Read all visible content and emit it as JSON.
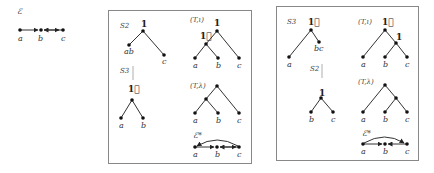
{
  "left_graph": {
    "title": "ℰ",
    "nodes": [
      "a",
      "b",
      "c"
    ]
  },
  "panels": [
    {
      "step_label": "S2",
      "step_tree": {
        "root": "1",
        "leaves": [
          "ab",
          "c"
        ]
      },
      "sub_step_label": "S3",
      "sub_tree": {
        "root": "1⃗",
        "leaves": [
          "a",
          "b"
        ]
      },
      "tree_t_iota": {
        "title": "(T,ι)",
        "root": "1",
        "inner": "1⃗",
        "leaves": [
          "a",
          "b",
          "c"
        ]
      },
      "tree_t_lambda": {
        "title": "(T,λ)",
        "leaves": [
          "a",
          "b",
          "c"
        ]
      },
      "closure": {
        "title": "ℰ*",
        "nodes": [
          "a",
          "b",
          "c"
        ]
      }
    },
    {
      "step_label": "S3",
      "step_tree": {
        "root": "1⃗",
        "leaves": [
          "a",
          "bc"
        ]
      },
      "sub_step_label": "S2",
      "sub_tree": {
        "root": "1",
        "leaves": [
          "b",
          "c"
        ]
      },
      "tree_t_iota": {
        "title": "(T,ι)",
        "root": "1⃗",
        "inner": "1",
        "leaves": [
          "a",
          "b",
          "c"
        ]
      },
      "tree_t_lambda": {
        "title": "(T,λ)",
        "leaves": [
          "a",
          "b",
          "c"
        ]
      },
      "closure": {
        "title": "ℰ*",
        "nodes": [
          "a",
          "b",
          "c"
        ]
      }
    }
  ]
}
